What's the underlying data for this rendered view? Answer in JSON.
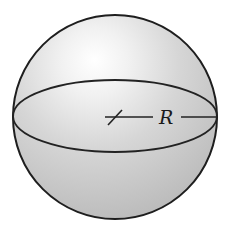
{
  "figure": {
    "width": 236,
    "height": 235
  },
  "sphere": {
    "cx": 115,
    "cy": 117,
    "r": 102,
    "fill_highlight": "#ffffff",
    "fill_mid": "#d9d9d9",
    "fill_shadow": "#bdbdbd",
    "stroke": "#1e1e1e"
  },
  "equator": {
    "cx": 115,
    "cy": 116,
    "rx": 102,
    "ry": 36,
    "stroke": "#222222"
  },
  "radius": {
    "x1": 105,
    "x2": 216,
    "y": 117,
    "gap_start": 153,
    "gap_end": 181,
    "tick": {
      "x1": 108,
      "y1": 125,
      "x2": 122,
      "y2": 110
    },
    "label": "R",
    "label_x": 159,
    "label_y": 124
  }
}
